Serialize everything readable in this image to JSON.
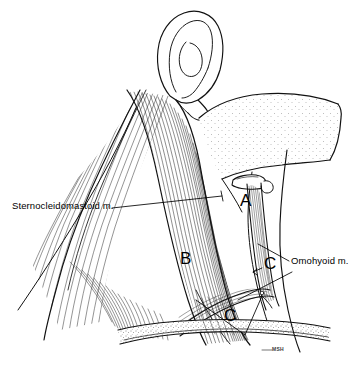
{
  "figure": {
    "background_color": "#ffffff",
    "ink_color": "#000000",
    "style": "pen-and-ink medical line illustration with hatching and stipple shading"
  },
  "labels": {
    "sternocleidomastoid": "Sternocleidomastoid m.",
    "omohyoid": "Omohyoid m.",
    "region_a": "A",
    "region_b": "B",
    "region_c_upper": "C",
    "region_c_lower": "C",
    "signature": "MSH"
  },
  "structures": [
    {
      "name": "auricle",
      "label": "ear"
    },
    {
      "name": "mandible",
      "label": "mandible"
    },
    {
      "name": "hyoid-bone",
      "label": "hyoid bone"
    },
    {
      "name": "clavicle",
      "label": "clavicle"
    },
    {
      "name": "sternocleidomastoid-muscle",
      "label": "sternocleidomastoid muscle"
    },
    {
      "name": "omohyoid-muscle",
      "label": "omohyoid muscle"
    },
    {
      "name": "trapezius-muscle",
      "label": "trapezius muscle"
    }
  ]
}
